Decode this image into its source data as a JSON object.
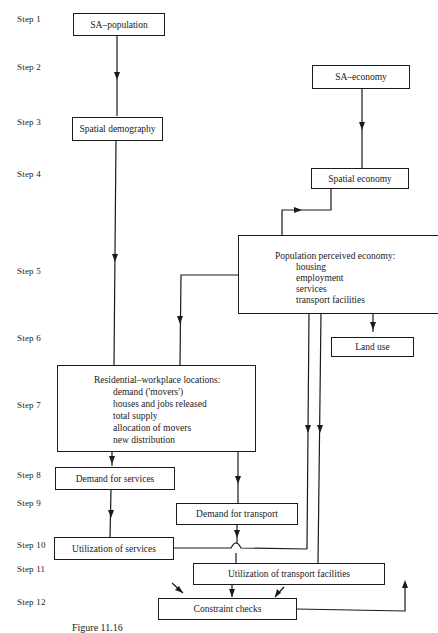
{
  "steps": [
    "Step 1",
    "Step 2",
    "Step 3",
    "Step 4",
    "Step 5",
    "Step 6",
    "Step 7",
    "Step 8",
    "Step 9",
    "Step 10",
    "Step 11",
    "Step 12"
  ],
  "boxes": {
    "sa_population": "SA–population",
    "sa_economy": "SA–economy",
    "spatial_demography": "Spatial demography",
    "spatial_economy": "Spatial economy",
    "population_perceived_economy": {
      "title": "Population perceived economy:",
      "items": [
        "housing",
        "employment",
        "services",
        "transport facilities"
      ]
    },
    "land_use": "Land use",
    "residential_workplace": {
      "title": "Residential–workplace locations:",
      "items": [
        "demand ('movers')",
        "houses and jobs released",
        "total supply",
        "allocation of movers",
        "new distribution"
      ]
    },
    "demand_for_services": "Demand for services",
    "demand_for_transport": "Demand for transport",
    "utilization_of_services": "Utilization of services",
    "utilization_of_transport": "Utilization of transport facilities",
    "constraint_checks": "Constraint checks"
  },
  "caption": "Figure 11.16"
}
